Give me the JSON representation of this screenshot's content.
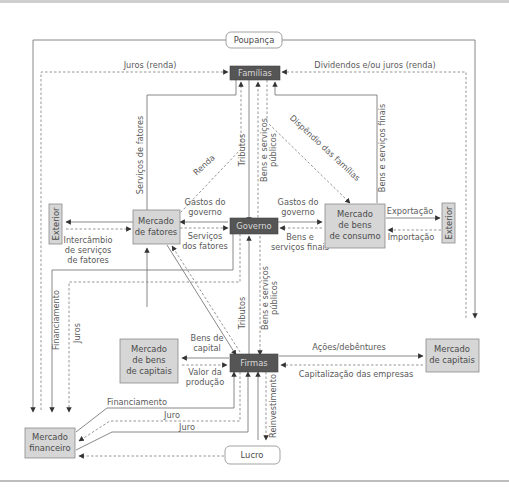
{
  "nodes": {
    "poupanca": "Poupança",
    "familias": "Famílias",
    "governo": "Governo",
    "firmas": "Firmas",
    "mercado_fatores": [
      "Mercado",
      "de fatores"
    ],
    "mercado_bens_consumo": [
      "Mercado",
      "de bens",
      "de consumo"
    ],
    "mercado_bens_capitais": [
      "Mercado",
      "de bens",
      "de capitais"
    ],
    "mercado_capitais": [
      "Mercado",
      "de capitais"
    ],
    "mercado_financeiro": [
      "Mercado",
      "financeiro"
    ],
    "exterior_left": "Exterior",
    "exterior_right": "Exterior",
    "lucro": "Lucro"
  },
  "flows": {
    "juros_renda": "Juros (renda)",
    "dividendos": "Dividendos e/ou juros (renda)",
    "servicos_fatores_vert": "Serviços de fatores",
    "renda": "Renda",
    "tributos_top": "Tributos",
    "bens_servicos_publicos_top": [
      "Bens e serviços",
      "públicos"
    ],
    "dispendio_familias": "Dispêndio das famílias",
    "bens_servicos_finais_vert": "Bens e serviços finais",
    "gastos_governo_left": [
      "Gastos do",
      "governo"
    ],
    "servicos_dos_fatores": [
      "Serviços",
      "dos fatores"
    ],
    "gastos_governo_right": [
      "Gastos do",
      "governo"
    ],
    "bens_servicos_finais": [
      "Bens e",
      "serviços finais"
    ],
    "intercambio": [
      "Intercâmbio",
      "de serviços",
      "de fatores"
    ],
    "exportacao": "Exportação",
    "importacao": "Importação",
    "financiamento_vert": "Financiamento",
    "juros_vert": "Juros",
    "tributos_bottom": "Tributos",
    "bens_servicos_publicos_bottom": [
      "Bens e serviços",
      "públicos"
    ],
    "bens_de_capital": [
      "Bens de",
      "capital"
    ],
    "valor_producao": [
      "Valor da",
      "produção"
    ],
    "acoes_debentures": "Ações/debêntures",
    "capitalizacao": "Capitalização das empresas",
    "financiamento": "Financiamento",
    "juro_1": "Juro",
    "juro_2": "Juro",
    "reinvestimento": "Reinvestimento"
  },
  "colors": {
    "dark_box": "#555555",
    "grey_box": "#d6d6d6",
    "line": "#7a7a7a"
  }
}
